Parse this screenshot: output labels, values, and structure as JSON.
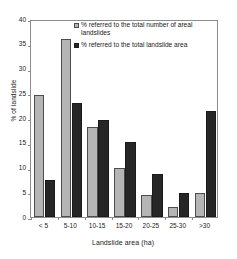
{
  "chart_data": {
    "type": "bar",
    "title": "",
    "xlabel": "Landslide area (ha)",
    "ylabel": "% of landslide",
    "categories": [
      "< 5",
      "5-10",
      "10-15",
      "15-20",
      "20-25",
      "25-30",
      ">30"
    ],
    "series": [
      {
        "name": "% referred to the total number of areal landslides",
        "color": "#b5b5b5",
        "values": [
          24.7,
          36.0,
          18.2,
          10.0,
          4.4,
          2.0,
          4.8
        ]
      },
      {
        "name": "% referred to the total landslide area",
        "color": "#262626",
        "values": [
          7.4,
          23.1,
          19.5,
          15.2,
          8.6,
          4.8,
          21.4
        ]
      }
    ],
    "ylim": [
      0,
      40
    ],
    "yticks": [
      0,
      5,
      10,
      15,
      20,
      25,
      30,
      35,
      40
    ],
    "grid": false,
    "legend_position": "top-right"
  },
  "legend": {
    "entries": [
      {
        "label": "% referred to the total number of areal landslides"
      },
      {
        "label": "% referred to the total landslide area"
      }
    ]
  }
}
